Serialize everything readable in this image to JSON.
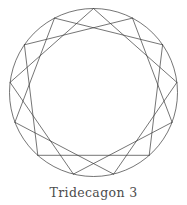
{
  "figure": {
    "caption": "Tridecagon 3",
    "stroke_color": "#3a3a3a",
    "circle_color": "#3a3a3a",
    "background_color": "#ffffff",
    "stroke_width": 0.7
  },
  "chart_data": {
    "type": "scatter",
    "title": "Tridecagon 3",
    "subtitle": "",
    "xlabel": "",
    "ylabel": "",
    "grid": false,
    "legend": "none",
    "polygon": {
      "name": "Tridecagon",
      "schlafli": "{13/3}",
      "n_vertices": 13,
      "step": 3,
      "center_x": 93.5,
      "center_y": 92.5,
      "radius": 84,
      "start_angle_deg": -90,
      "circumscribed_circle": true
    },
    "vertices": [
      {
        "index": 0,
        "angle_deg": -90.0,
        "x": 93.5,
        "y": 8.5
      },
      {
        "index": 1,
        "angle_deg": -62.31,
        "x": 132.5,
        "y": 18.1
      },
      {
        "index": 2,
        "angle_deg": -34.62,
        "x": 162.6,
        "y": 44.8
      },
      {
        "index": 3,
        "angle_deg": -6.92,
        "x": 176.9,
        "y": 82.4
      },
      {
        "index": 4,
        "angle_deg": 20.77,
        "x": 172.1,
        "y": 122.3
      },
      {
        "index": 5,
        "angle_deg": 48.46,
        "x": 149.2,
        "y": 155.3
      },
      {
        "index": 6,
        "angle_deg": 76.15,
        "x": 113.6,
        "y": 174.1
      },
      {
        "index": 7,
        "angle_deg": 103.85,
        "x": 73.4,
        "y": 174.1
      },
      {
        "index": 8,
        "angle_deg": 131.54,
        "x": 37.8,
        "y": 155.3
      },
      {
        "index": 9,
        "angle_deg": 159.23,
        "x": 14.9,
        "y": 122.3
      },
      {
        "index": 10,
        "angle_deg": 186.92,
        "x": 10.1,
        "y": 82.4
      },
      {
        "index": 11,
        "angle_deg": 214.62,
        "x": 24.4,
        "y": 44.8
      },
      {
        "index": 12,
        "angle_deg": 242.31,
        "x": 54.5,
        "y": 18.1
      }
    ],
    "edges": [
      [
        0,
        3
      ],
      [
        3,
        6
      ],
      [
        6,
        9
      ],
      [
        9,
        12
      ],
      [
        12,
        2
      ],
      [
        2,
        5
      ],
      [
        5,
        8
      ],
      [
        8,
        11
      ],
      [
        11,
        1
      ],
      [
        1,
        4
      ],
      [
        4,
        7
      ],
      [
        7,
        10
      ],
      [
        10,
        0
      ]
    ],
    "x": [
      93.5,
      132.5,
      162.6,
      176.9,
      172.1,
      149.2,
      113.6,
      73.4,
      37.8,
      14.9,
      10.1,
      24.4,
      54.5
    ],
    "values": [
      8.5,
      18.1,
      44.8,
      82.4,
      122.3,
      155.3,
      174.1,
      174.1,
      155.3,
      122.3,
      82.4,
      44.8,
      18.1
    ]
  }
}
